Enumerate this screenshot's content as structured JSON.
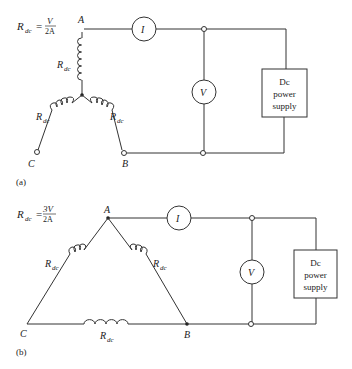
{
  "figure_a": {
    "label": "(a)",
    "formula": {
      "lhs": "R",
      "lhs_sub": "dc",
      "eq": "=",
      "num": "V",
      "den": "2A"
    },
    "nodes": {
      "A": "A",
      "B": "B",
      "C": "C"
    },
    "winding_label": "R",
    "winding_sub": "dc",
    "ammeter": "I",
    "voltmeter": "V",
    "supply": [
      "Dc",
      "power",
      "supply"
    ]
  },
  "figure_b": {
    "label": "(b)",
    "formula": {
      "lhs": "R",
      "lhs_sub": "dc",
      "eq": "=",
      "num": "3V",
      "den": "2A"
    },
    "nodes": {
      "A": "A",
      "B": "B",
      "C": "C"
    },
    "winding_label": "R",
    "winding_sub": "dc",
    "ammeter": "I",
    "voltmeter": "V",
    "supply": [
      "Dc",
      "power",
      "supply"
    ]
  }
}
